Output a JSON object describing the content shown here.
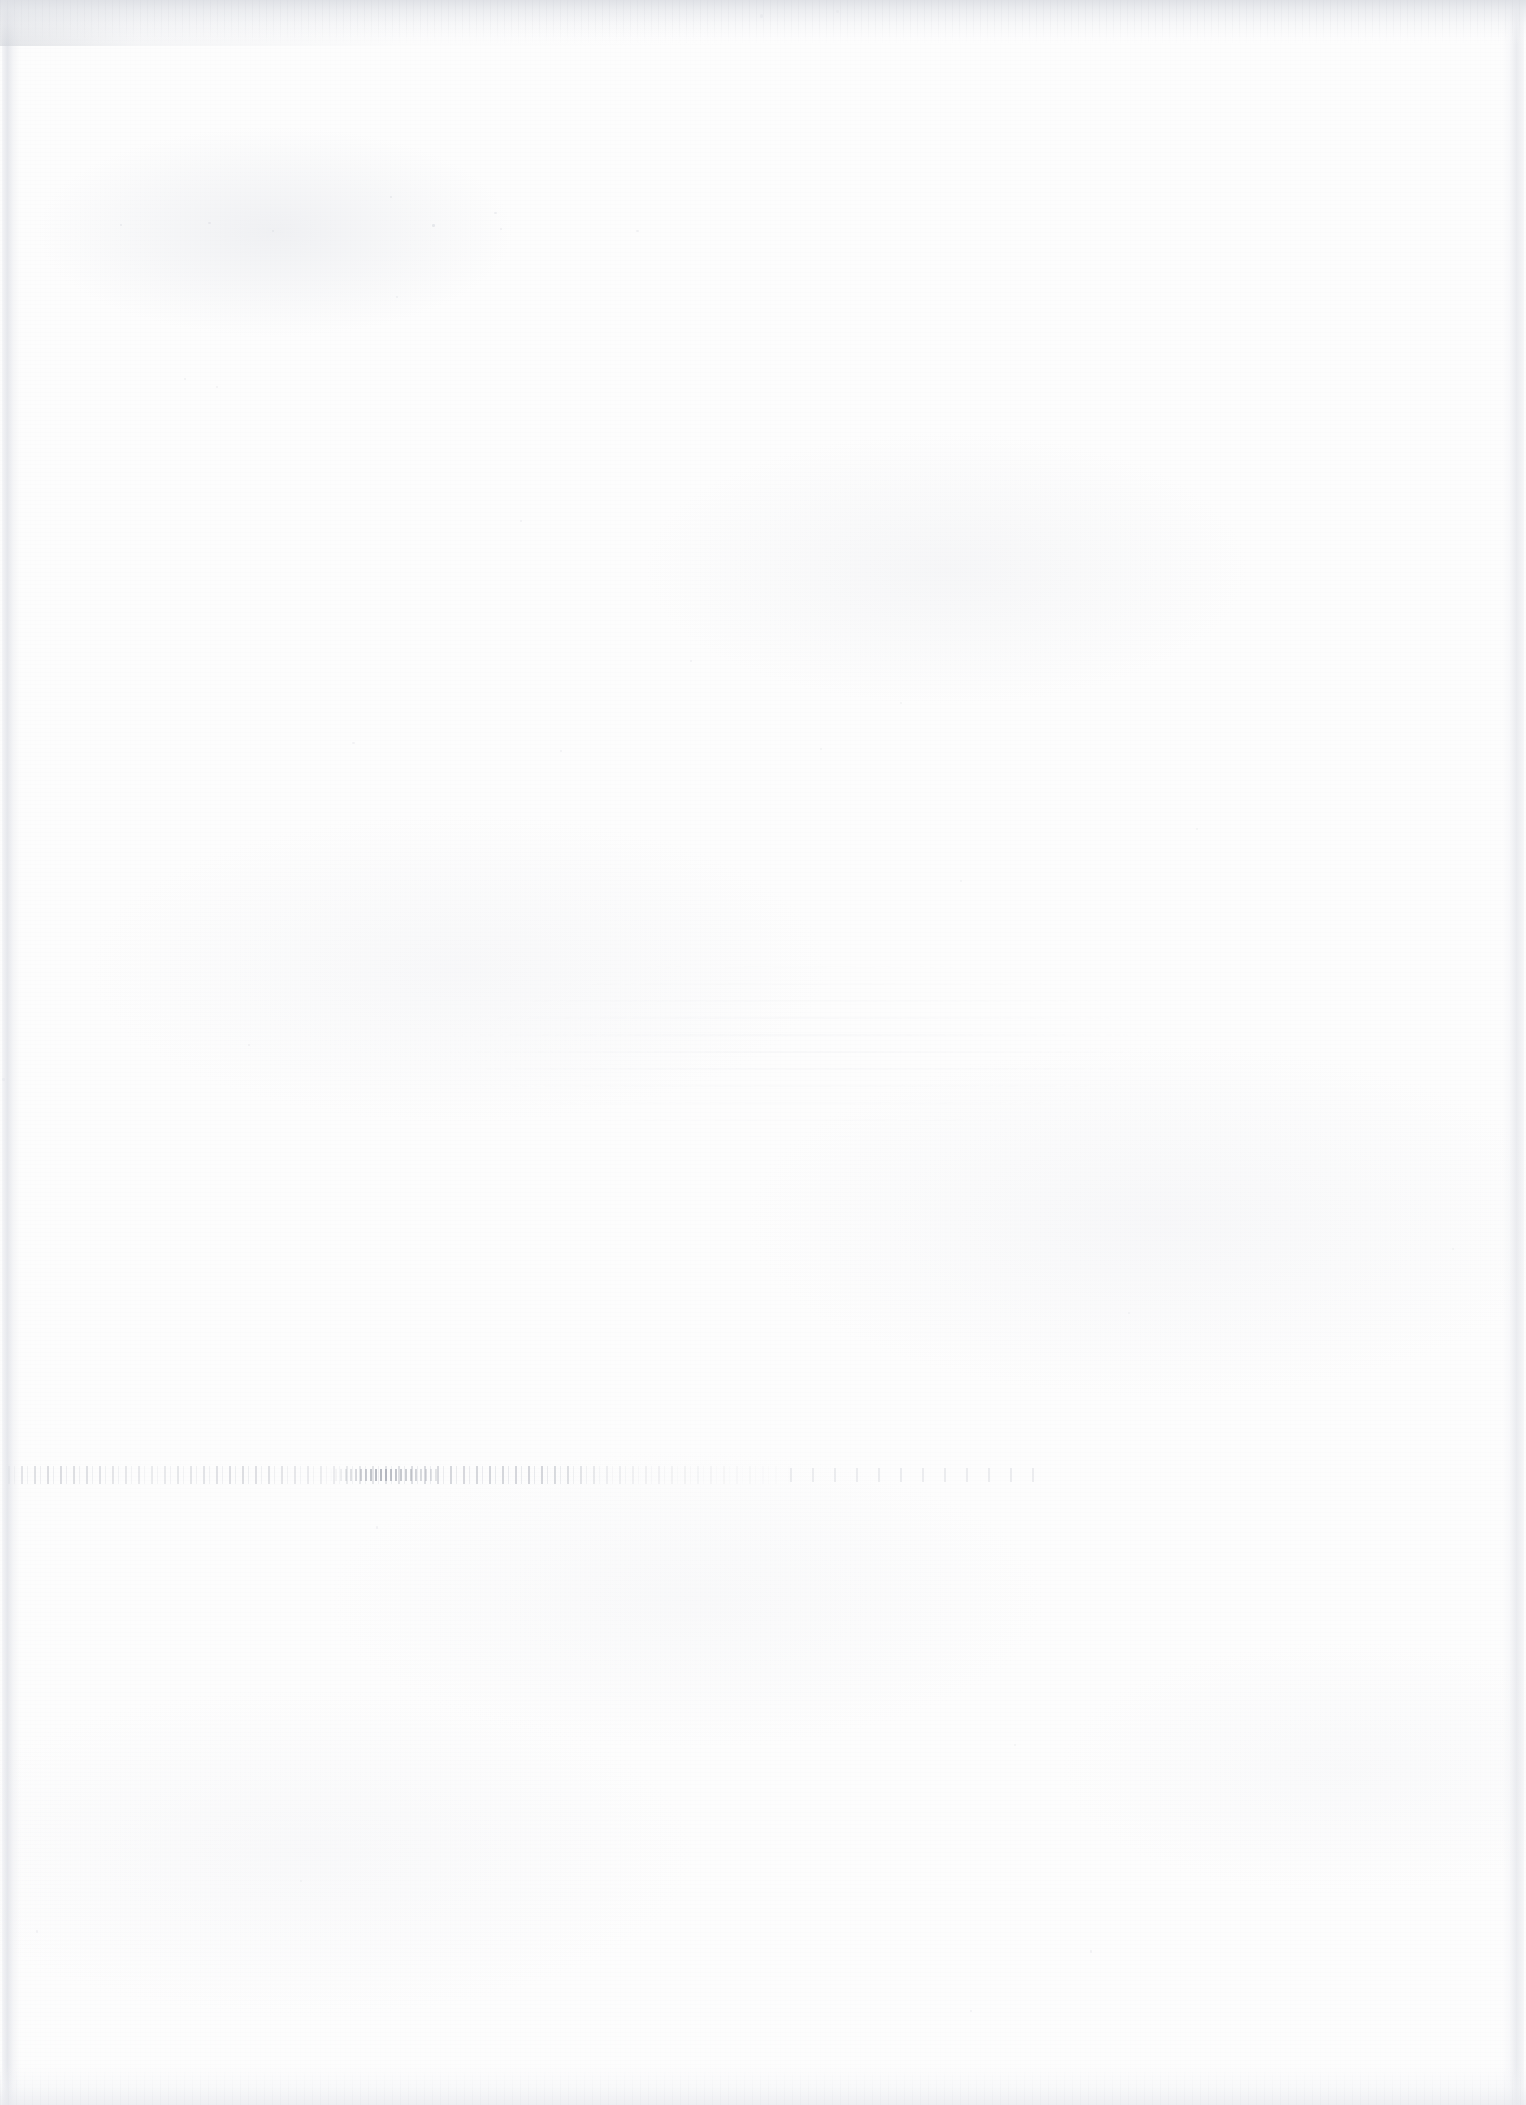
{
  "page": {
    "kind": "scanned-blank-page",
    "width": 1526,
    "height": 2105,
    "orientation": "portrait",
    "text_content": "",
    "visible_text_count": 0
  },
  "colors": {
    "paper_background": "#fdfdfd",
    "paper_mottle": "#e9eaee",
    "scanner_edge_band": "#e8e9ec",
    "edge_shadow": "#e0e2e8",
    "speck": "#cdd0d7",
    "speck_dark": "#a0a4ae",
    "ghost_showthrough": "#dee0e6"
  },
  "artifacts": [
    {
      "name": "top-scanner-edge-band",
      "type": "scanner-edge",
      "x": 0,
      "y": 0,
      "width": 1526,
      "height": 46,
      "note": "Grainy gray band along the top edge with faint vertical streaks, darkest toward the left."
    },
    {
      "name": "left-page-edge-shadow",
      "type": "page-edge",
      "x": 2,
      "y": 0,
      "width": 18,
      "height": 2105,
      "note": "Faint vertical edge shadow running the full page height."
    },
    {
      "name": "right-page-edge-shadow",
      "type": "page-edge",
      "x": 1502,
      "y": 0,
      "width": 22,
      "height": 2105,
      "note": "Faint vertical edge band near the right margin."
    },
    {
      "name": "bottom-scanner-edge-band",
      "type": "scanner-edge",
      "x": 0,
      "y": 2065,
      "width": 1526,
      "height": 40,
      "note": "Light grainy band along the bottom edge."
    },
    {
      "name": "center-showthrough-ghost",
      "type": "show-through",
      "x": 430,
      "y": 958,
      "width": 740,
      "height": 180,
      "note": "Barely perceptible mottled ghosting of text blocks from the reverse side; fully illegible."
    },
    {
      "name": "horizontal-speck-line",
      "type": "show-through",
      "x": 8,
      "y": 1466,
      "width": 1042,
      "height": 18,
      "note": "Broken horizontal row of faint specks, offset/show-through of one text line; fully illegible."
    },
    {
      "name": "scattered-dust-specks",
      "type": "dust",
      "note": "Isolated low-contrast specks distributed across the page."
    }
  ],
  "specks": [
    {
      "x": 432,
      "y": 224,
      "w": 3,
      "h": 3,
      "o": 0.55
    },
    {
      "x": 390,
      "y": 196,
      "w": 2,
      "h": 2,
      "o": 0.45
    },
    {
      "x": 494,
      "y": 212,
      "w": 3,
      "h": 2,
      "o": 0.4
    },
    {
      "x": 500,
      "y": 228,
      "w": 2,
      "h": 2,
      "o": 0.38
    },
    {
      "x": 208,
      "y": 222,
      "w": 3,
      "h": 2,
      "o": 0.42
    },
    {
      "x": 120,
      "y": 224,
      "w": 2,
      "h": 2,
      "o": 0.4
    },
    {
      "x": 272,
      "y": 230,
      "w": 2,
      "h": 2,
      "o": 0.36
    },
    {
      "x": 636,
      "y": 230,
      "w": 3,
      "h": 2,
      "o": 0.34
    },
    {
      "x": 760,
      "y": 14,
      "w": 3,
      "h": 4,
      "o": 0.5
    },
    {
      "x": 836,
      "y": 10,
      "w": 3,
      "h": 3,
      "o": 0.46
    },
    {
      "x": 184,
      "y": 378,
      "w": 2,
      "h": 2,
      "o": 0.32
    },
    {
      "x": 216,
      "y": 386,
      "w": 2,
      "h": 2,
      "o": 0.3
    },
    {
      "x": 396,
      "y": 296,
      "w": 2,
      "h": 2,
      "o": 0.34
    },
    {
      "x": 520,
      "y": 520,
      "w": 2,
      "h": 2,
      "o": 0.28
    },
    {
      "x": 690,
      "y": 660,
      "w": 2,
      "h": 2,
      "o": 0.28
    },
    {
      "x": 900,
      "y": 702,
      "w": 2,
      "h": 2,
      "o": 0.26
    },
    {
      "x": 352,
      "y": 742,
      "w": 3,
      "h": 2,
      "o": 0.3
    },
    {
      "x": 560,
      "y": 750,
      "w": 2,
      "h": 2,
      "o": 0.28
    },
    {
      "x": 820,
      "y": 748,
      "w": 2,
      "h": 2,
      "o": 0.26
    },
    {
      "x": 1196,
      "y": 828,
      "w": 2,
      "h": 2,
      "o": 0.26
    },
    {
      "x": 960,
      "y": 880,
      "w": 2,
      "h": 2,
      "o": 0.24
    },
    {
      "x": 248,
      "y": 1044,
      "w": 2,
      "h": 2,
      "o": 0.3
    },
    {
      "x": 2,
      "y": 1078,
      "w": 3,
      "h": 3,
      "o": 0.45
    },
    {
      "x": 1452,
      "y": 1248,
      "w": 2,
      "h": 2,
      "o": 0.26
    },
    {
      "x": 1128,
      "y": 1312,
      "w": 2,
      "h": 2,
      "o": 0.24
    },
    {
      "x": 376,
      "y": 1526,
      "w": 2,
      "h": 3,
      "o": 0.3
    },
    {
      "x": 1014,
      "y": 1744,
      "w": 2,
      "h": 2,
      "o": 0.26
    },
    {
      "x": 1660,
      "y": 1840,
      "w": 2,
      "h": 2,
      "o": 0.22
    },
    {
      "x": 300,
      "y": 1880,
      "w": 2,
      "h": 2,
      "o": 0.24
    },
    {
      "x": 1090,
      "y": 1950,
      "w": 2,
      "h": 3,
      "o": 0.3
    },
    {
      "x": 970,
      "y": 2010,
      "w": 2,
      "h": 2,
      "o": 0.28
    },
    {
      "x": 36,
      "y": 1930,
      "w": 2,
      "h": 3,
      "o": 0.3
    }
  ]
}
